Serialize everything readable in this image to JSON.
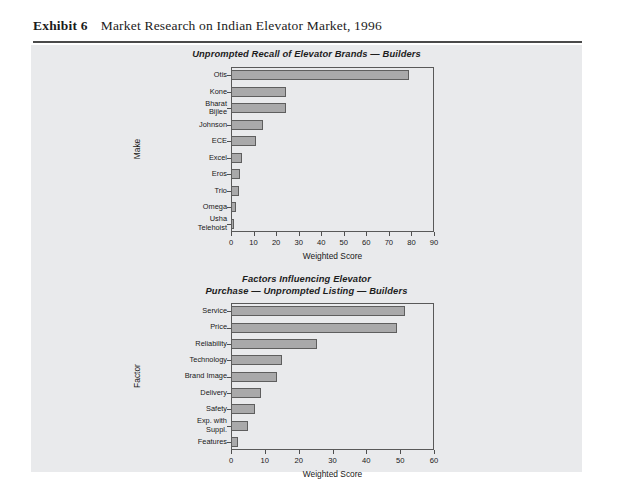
{
  "exhibit": {
    "label": "Exhibit 6",
    "title": "Market Research on Indian Elevator Market, 1996"
  },
  "chart_data": [
    {
      "id": "chart-builders-recall",
      "type": "bar",
      "orientation": "horizontal",
      "title": "Unprompted Recall of Elevator Brands — Builders",
      "title_lines": [
        "Unprompted Recall of Elevator Brands — Builders"
      ],
      "categories": [
        "Otis",
        "Kone",
        "Bharat\nBijlee",
        "Johnson",
        "ECE",
        "Excel",
        "Eros",
        "Trio",
        "Omega",
        "Usha\nTelehoist"
      ],
      "values": [
        79,
        24.5,
        24.5,
        14,
        11,
        5,
        4,
        3.5,
        2,
        1.5
      ],
      "xlabel": "Weighted Score",
      "ylabel": "Make",
      "xlim": [
        0,
        90
      ],
      "xticks": [
        0,
        10,
        20,
        30,
        40,
        50,
        60,
        70,
        80,
        90
      ],
      "grid": false,
      "bar_color": "#a9a9aa",
      "bar_edge_color": "#5e5e5e"
    },
    {
      "id": "chart-builders-factors",
      "type": "bar",
      "orientation": "horizontal",
      "title": "Factors Influencing Elevator Purchase — Unprompted Listing — Builders",
      "title_lines": [
        "Factors Influencing Elevator",
        "Purchase — Unprompted Listing — Builders"
      ],
      "categories": [
        "Service",
        "Price",
        "Reliability",
        "Technology",
        "Brand Image",
        "Delivery",
        "Safety",
        "Exp. with\nSuppl.",
        "Features"
      ],
      "values": [
        51.5,
        49,
        25.5,
        15,
        13.5,
        9,
        7,
        5,
        2
      ],
      "xlabel": "Weighted Score",
      "ylabel": "Factor",
      "xlim": [
        0,
        60
      ],
      "xticks": [
        0,
        10,
        20,
        30,
        40,
        50,
        60
      ],
      "grid": false,
      "bar_color": "#a9a9aa",
      "bar_edge_color": "#5e5e5e"
    }
  ]
}
